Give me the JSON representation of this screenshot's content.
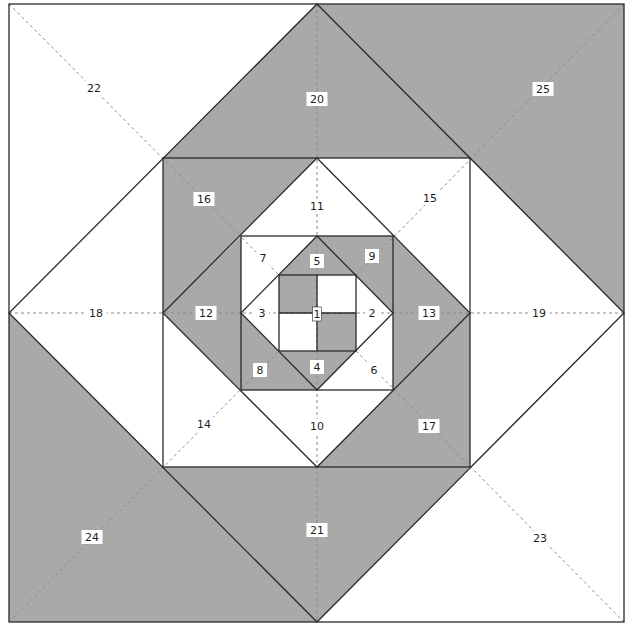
{
  "diagram": {
    "type": "quilt-block-piecing-diagram",
    "colors": {
      "gray": "#a9a9a9",
      "white": "#ffffff",
      "line": "#2a2a2a",
      "dash": "#8a8a8a"
    },
    "center": [
      317,
      313
    ],
    "rings": [
      {
        "name": "center-square",
        "shape": "square",
        "bounds": [
          279,
          275,
          356,
          351
        ]
      },
      {
        "name": "diamond-1",
        "shape": "diamond",
        "top": [
          317,
          236
        ],
        "right": [
          393,
          313
        ],
        "bottom": [
          317,
          390
        ],
        "left": [
          241,
          313
        ]
      },
      {
        "name": "square-c",
        "shape": "square",
        "bounds": [
          241,
          236,
          393,
          390
        ]
      },
      {
        "name": "diamond-2",
        "shape": "diamond",
        "top": [
          317,
          158
        ],
        "right": [
          470,
          313
        ],
        "bottom": [
          317,
          467
        ],
        "left": [
          163,
          313
        ]
      },
      {
        "name": "square-b",
        "shape": "square",
        "bounds": [
          163,
          158,
          470,
          467
        ]
      },
      {
        "name": "diamond-3",
        "shape": "diamond",
        "top": [
          317,
          4
        ],
        "right": [
          624,
          313
        ],
        "bottom": [
          317,
          622
        ],
        "left": [
          9,
          313
        ]
      },
      {
        "name": "outer-square",
        "shape": "square",
        "bounds": [
          9,
          4,
          624,
          622
        ]
      }
    ],
    "pieces": [
      {
        "id": "1",
        "fill": "gray",
        "points": [
          [
            279,
            275
          ],
          [
            317,
            275
          ],
          [
            317,
            313
          ],
          [
            279,
            313
          ]
        ],
        "label": "1",
        "pos": [
          317,
          314
        ],
        "boxed": true
      },
      {
        "id": "1b",
        "fill": "white",
        "points": [
          [
            317,
            275
          ],
          [
            356,
            275
          ],
          [
            356,
            313
          ],
          [
            317,
            313
          ]
        ]
      },
      {
        "id": "1c",
        "fill": "white",
        "points": [
          [
            279,
            313
          ],
          [
            317,
            313
          ],
          [
            317,
            351
          ],
          [
            279,
            351
          ]
        ]
      },
      {
        "id": "1d",
        "fill": "gray",
        "points": [
          [
            317,
            313
          ],
          [
            356,
            313
          ],
          [
            356,
            351
          ],
          [
            317,
            351
          ]
        ]
      },
      {
        "id": "5",
        "fill": "gray",
        "points": [
          [
            279,
            275
          ],
          [
            317,
            236
          ],
          [
            356,
            275
          ]
        ],
        "label": "5",
        "pos": [
          317,
          261
        ]
      },
      {
        "id": "2",
        "fill": "white",
        "points": [
          [
            356,
            275
          ],
          [
            393,
            313
          ],
          [
            356,
            351
          ]
        ],
        "label": "2",
        "pos": [
          372,
          313
        ]
      },
      {
        "id": "4",
        "fill": "gray",
        "points": [
          [
            279,
            351
          ],
          [
            317,
            390
          ],
          [
            356,
            351
          ]
        ],
        "label": "4",
        "pos": [
          317,
          367
        ]
      },
      {
        "id": "3",
        "fill": "white",
        "points": [
          [
            279,
            275
          ],
          [
            241,
            313
          ],
          [
            279,
            351
          ]
        ],
        "label": "3",
        "pos": [
          262,
          313
        ]
      },
      {
        "id": "7",
        "fill": "white",
        "points": [
          [
            241,
            236
          ],
          [
            317,
            236
          ],
          [
            241,
            313
          ]
        ],
        "label": "7",
        "pos": [
          263,
          258
        ]
      },
      {
        "id": "9",
        "fill": "gray",
        "points": [
          [
            317,
            236
          ],
          [
            393,
            236
          ],
          [
            393,
            313
          ]
        ],
        "label": "9",
        "pos": [
          372,
          256
        ]
      },
      {
        "id": "8",
        "fill": "gray",
        "points": [
          [
            241,
            313
          ],
          [
            241,
            390
          ],
          [
            317,
            390
          ]
        ],
        "label": "8",
        "pos": [
          260,
          370
        ]
      },
      {
        "id": "6",
        "fill": "white",
        "points": [
          [
            393,
            313
          ],
          [
            393,
            390
          ],
          [
            317,
            390
          ]
        ],
        "label": "6",
        "pos": [
          374,
          370
        ]
      },
      {
        "id": "11",
        "fill": "white",
        "points": [
          [
            241,
            236
          ],
          [
            317,
            158
          ],
          [
            393,
            236
          ]
        ],
        "label": "11",
        "pos": [
          317,
          206
        ]
      },
      {
        "id": "13",
        "fill": "gray",
        "points": [
          [
            393,
            236
          ],
          [
            470,
            313
          ],
          [
            393,
            390
          ]
        ],
        "label": "13",
        "pos": [
          429,
          313
        ]
      },
      {
        "id": "10",
        "fill": "white",
        "points": [
          [
            241,
            390
          ],
          [
            317,
            467
          ],
          [
            393,
            390
          ]
        ],
        "label": "10",
        "pos": [
          317,
          426
        ]
      },
      {
        "id": "12",
        "fill": "gray",
        "points": [
          [
            241,
            236
          ],
          [
            163,
            313
          ],
          [
            241,
            390
          ]
        ],
        "label": "12",
        "pos": [
          206,
          313
        ]
      },
      {
        "id": "16",
        "fill": "gray",
        "points": [
          [
            163,
            158
          ],
          [
            317,
            158
          ],
          [
            163,
            313
          ]
        ],
        "label": "16",
        "pos": [
          204,
          199
        ]
      },
      {
        "id": "15",
        "fill": "white",
        "points": [
          [
            317,
            158
          ],
          [
            470,
            158
          ],
          [
            470,
            313
          ]
        ],
        "label": "15",
        "pos": [
          430,
          198
        ]
      },
      {
        "id": "14",
        "fill": "white",
        "points": [
          [
            163,
            313
          ],
          [
            163,
            467
          ],
          [
            317,
            467
          ]
        ],
        "label": "14",
        "pos": [
          204,
          424
        ]
      },
      {
        "id": "17",
        "fill": "gray",
        "points": [
          [
            470,
            313
          ],
          [
            470,
            467
          ],
          [
            317,
            467
          ]
        ],
        "label": "17",
        "pos": [
          429,
          426
        ]
      },
      {
        "id": "20",
        "fill": "gray",
        "points": [
          [
            163,
            158
          ],
          [
            317,
            4
          ],
          [
            470,
            158
          ]
        ],
        "label": "20",
        "pos": [
          317,
          99
        ]
      },
      {
        "id": "19",
        "fill": "white",
        "points": [
          [
            470,
            158
          ],
          [
            624,
            313
          ],
          [
            470,
            467
          ]
        ],
        "label": "19",
        "pos": [
          539,
          313
        ]
      },
      {
        "id": "21",
        "fill": "gray",
        "points": [
          [
            163,
            467
          ],
          [
            317,
            622
          ],
          [
            470,
            467
          ]
        ],
        "label": "21",
        "pos": [
          317,
          530
        ]
      },
      {
        "id": "18",
        "fill": "white",
        "points": [
          [
            163,
            158
          ],
          [
            9,
            313
          ],
          [
            163,
            467
          ]
        ],
        "label": "18",
        "pos": [
          96,
          313
        ]
      },
      {
        "id": "22",
        "fill": "white",
        "points": [
          [
            9,
            4
          ],
          [
            317,
            4
          ],
          [
            9,
            313
          ]
        ],
        "label": "22",
        "pos": [
          94,
          88
        ]
      },
      {
        "id": "25",
        "fill": "gray",
        "points": [
          [
            317,
            4
          ],
          [
            624,
            4
          ],
          [
            624,
            313
          ]
        ],
        "label": "25",
        "pos": [
          543,
          89
        ]
      },
      {
        "id": "24",
        "fill": "gray",
        "points": [
          [
            9,
            313
          ],
          [
            9,
            622
          ],
          [
            317,
            622
          ]
        ],
        "label": "24",
        "pos": [
          92,
          537
        ]
      },
      {
        "id": "23",
        "fill": "white",
        "points": [
          [
            624,
            313
          ],
          [
            624,
            622
          ],
          [
            317,
            622
          ]
        ],
        "label": "23",
        "pos": [
          540,
          538
        ]
      }
    ],
    "dashed_lines": [
      [
        [
          317,
          4
        ],
        [
          317,
          622
        ]
      ],
      [
        [
          9,
          313
        ],
        [
          624,
          313
        ]
      ],
      [
        [
          9,
          4
        ],
        [
          279,
          275
        ]
      ],
      [
        [
          624,
          4
        ],
        [
          356,
          275
        ]
      ],
      [
        [
          9,
          622
        ],
        [
          279,
          351
        ]
      ],
      [
        [
          624,
          622
        ],
        [
          356,
          351
        ]
      ]
    ]
  }
}
